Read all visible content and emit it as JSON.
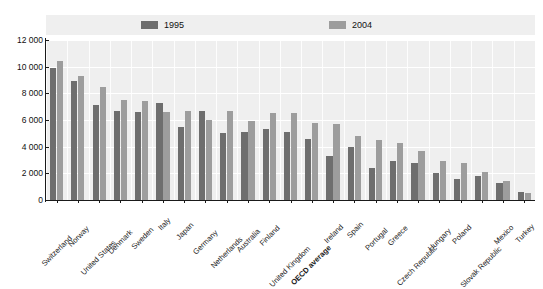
{
  "chart_data": {
    "type": "bar",
    "title": "",
    "subtitle": "",
    "xlabel": "",
    "ylabel": "",
    "ylim": [
      0,
      12000
    ],
    "yticks": [
      0,
      2000,
      4000,
      6000,
      8000,
      10000,
      12000
    ],
    "ytick_labels": [
      "0",
      "2 000",
      "4 000",
      "6 000",
      "8 000",
      "10 000",
      "12 000"
    ],
    "grid": true,
    "legend_position": "top",
    "categories": [
      "Switzerland",
      "Norway",
      "United States",
      "Denmark",
      "Sweden",
      "Italy",
      "Japan",
      "Germany",
      "Netherlands",
      "Australia",
      "Finland",
      "United Kingdom",
      "OECD average",
      "Ireland",
      "Spain",
      "Portugal",
      "Greece",
      "Czech Republic",
      "Hungary",
      "Poland",
      "Slovak Republic",
      "Mexico",
      "Turkey"
    ],
    "highlight_category": "OECD average",
    "series": [
      {
        "name": "1995",
        "color": "#6e6e6e",
        "values": [
          9900,
          8900,
          7100,
          6700,
          6600,
          7300,
          5500,
          6700,
          5000,
          5100,
          5300,
          5100,
          4600,
          3300,
          4000,
          2400,
          2900,
          2800,
          2000,
          1600,
          1800,
          1300,
          600
        ]
      },
      {
        "name": "2004",
        "color": "#9d9d9d",
        "values": [
          10400,
          9300,
          8500,
          7500,
          7400,
          6600,
          6700,
          6000,
          6700,
          5900,
          6500,
          6500,
          5800,
          5700,
          4800,
          4500,
          4300,
          3700,
          2900,
          2800,
          2100,
          1400,
          550
        ]
      }
    ]
  }
}
